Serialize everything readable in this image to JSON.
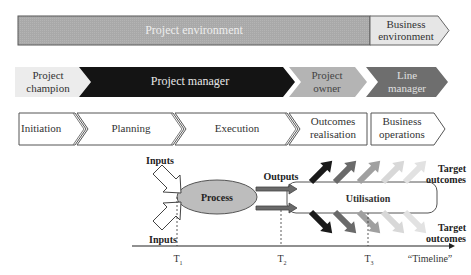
{
  "row1": {
    "project_environment": "Project environment",
    "business_environment_line1": "Business",
    "business_environment_line2": "environment"
  },
  "row2": {
    "project_champion_line1": "Project",
    "project_champion_line2": "champion",
    "project_manager": "Project manager",
    "project_owner_line1": "Project",
    "project_owner_line2": "owner",
    "line_manager_line1": "Line",
    "line_manager_line2": "manager"
  },
  "row3": {
    "initiation": "Initiation",
    "planning": "Planning",
    "execution": "Execution",
    "outcomes_line1": "Outcomes",
    "outcomes_line2": "realisation",
    "business_ops_line1": "Business",
    "business_ops_line2": "operations"
  },
  "process": {
    "inputs_top": "Inputs",
    "inputs_bottom": "Inputs",
    "process": "Process",
    "outputs": "Outputs",
    "utilisation": "Utilisation",
    "target_top_line1": "Target",
    "target_top_line2": "outcomes",
    "target_bottom_line1": "Target",
    "target_bottom_line2": "outcomes"
  },
  "timeline": {
    "t1": "T",
    "t1_sub": "1",
    "t2": "T",
    "t2_sub": "2",
    "t3": "T",
    "t3_sub": "3",
    "label": "“Timeline”"
  },
  "colors": {
    "project_env_fill": "#a8a8a8",
    "business_env_fill": "#e6e6e6",
    "champion_fill": "#ececec",
    "manager_fill": "#141414",
    "owner_fill": "#b4b4b4",
    "line_manager_fill": "#6e6e6e",
    "process_fill": "#bdbdbd",
    "arrow_shades": [
      "#1a1a1a",
      "#6a6a6a",
      "#9a9a9a",
      "#d6d6d6",
      "#e4e4e4"
    ]
  }
}
